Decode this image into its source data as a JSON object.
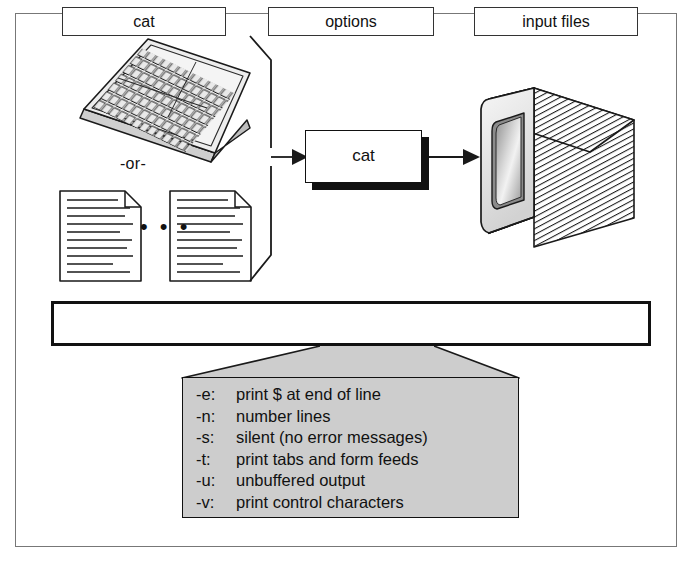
{
  "figure": {
    "background_color": "#ffffff",
    "frame_color": "#777777",
    "panel_gray": "#cdcdcd",
    "ink_color": "#111111"
  },
  "flow": {
    "input_or_label": "-or-",
    "documents_ellipsis": "• • •",
    "process_label": "cat",
    "keyboard_icon": "keyboard-icon",
    "document_icon": "document-page-icon",
    "monitor_icon": "crt-monitor-icon",
    "input_bracket_icon": "input-brace-icon",
    "arrow_in_icon": "arrow-right-icon",
    "arrow_out_icon": "arrow-right-icon"
  },
  "syntax": {
    "parts": [
      {
        "name": "command",
        "label": "cat"
      },
      {
        "name": "options",
        "label": "options"
      },
      {
        "name": "input-files",
        "label": "input files"
      }
    ]
  },
  "options_panel": {
    "funnel_icon": "funnel-callout-icon",
    "items": [
      {
        "flag": "-e:",
        "description": "print $ at end of line"
      },
      {
        "flag": "-n:",
        "description": "number lines"
      },
      {
        "flag": "-s:",
        "description": "silent (no error messages)"
      },
      {
        "flag": "-t:",
        "description": "print tabs and form feeds"
      },
      {
        "flag": "-u:",
        "description": "unbuffered output"
      },
      {
        "flag": "-v:",
        "description": "print control characters"
      }
    ]
  }
}
